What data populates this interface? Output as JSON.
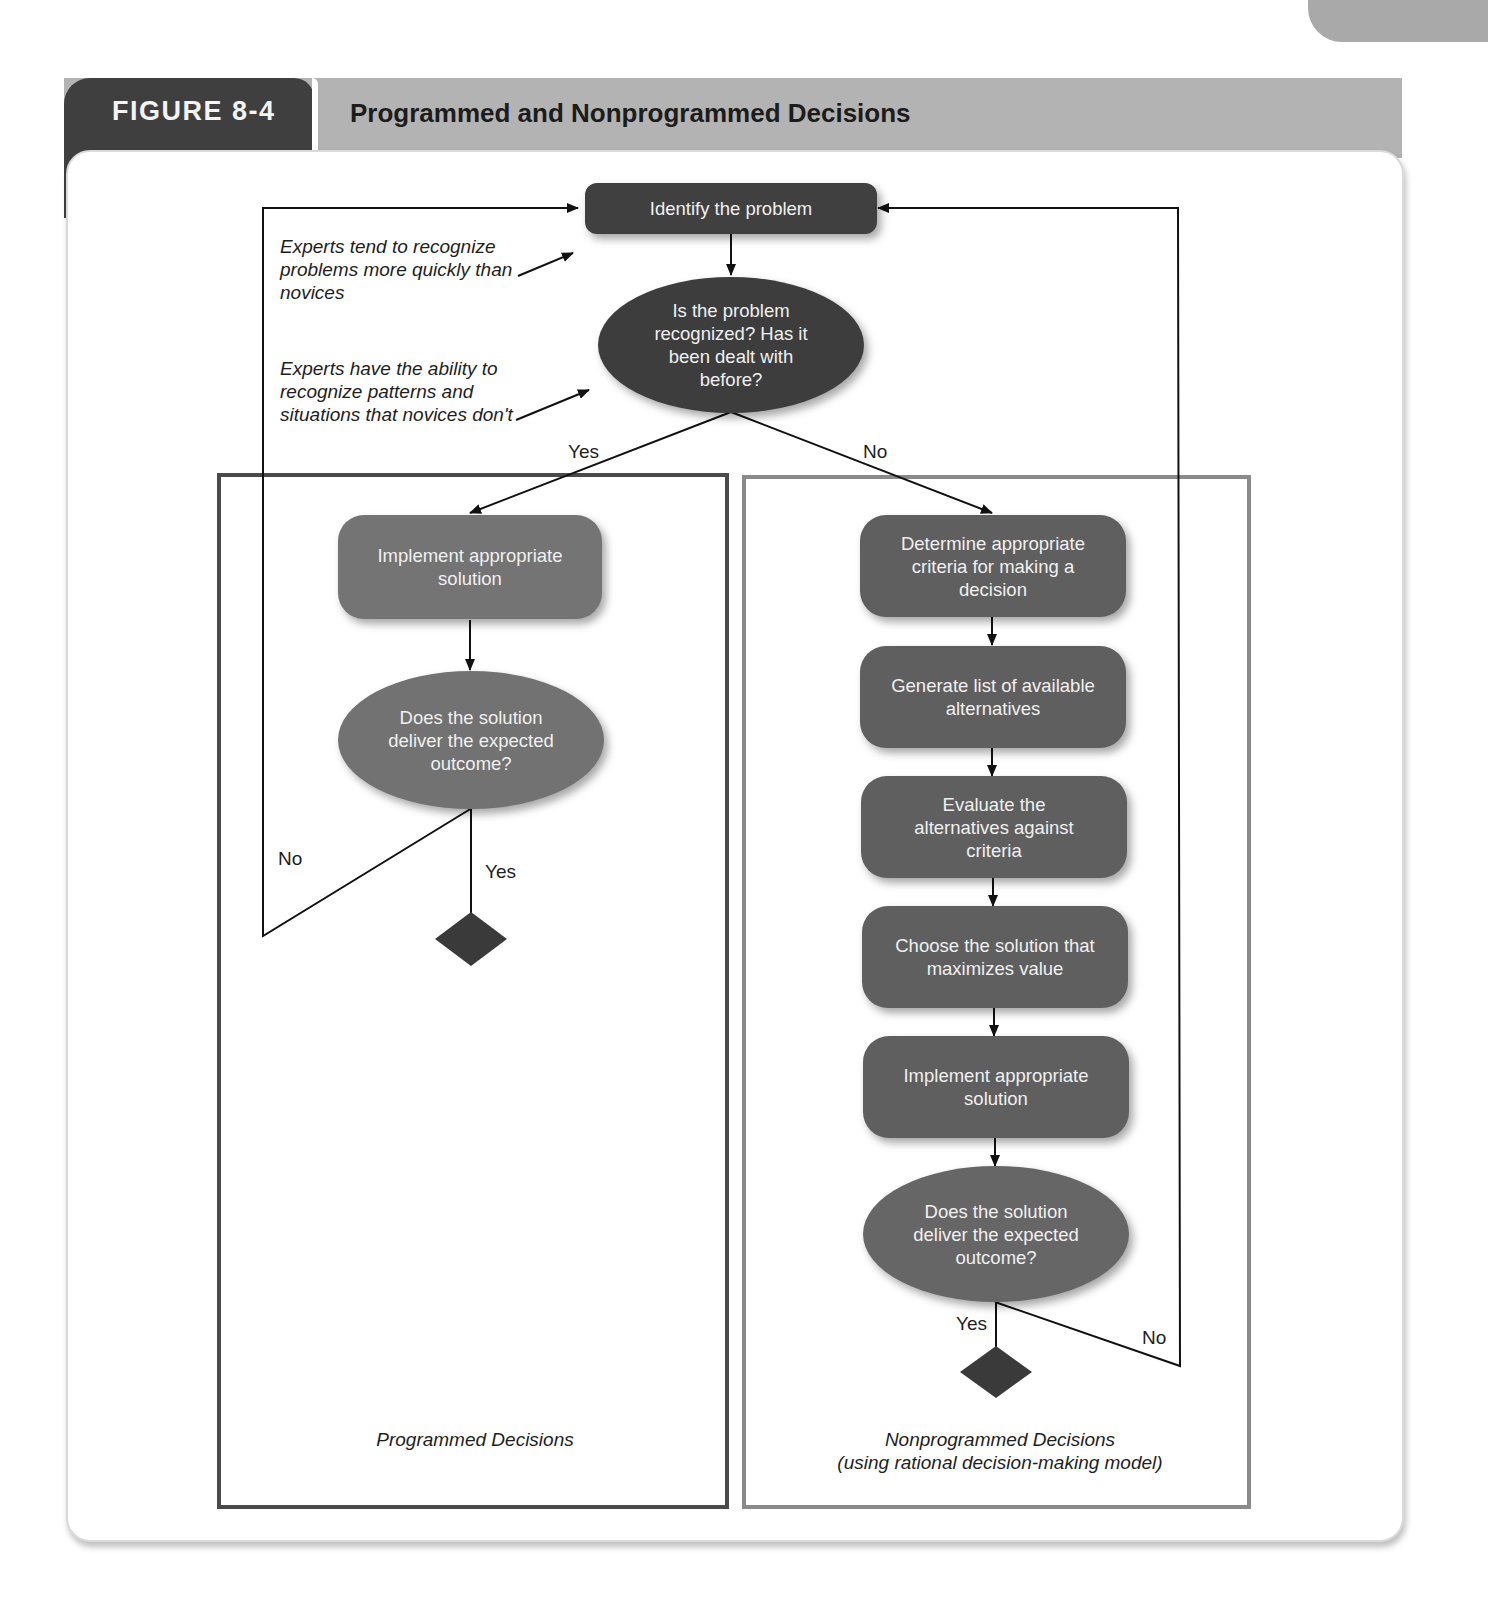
{
  "figure": {
    "label": "FIGURE 8-4",
    "title": "Programmed and Nonprogrammed Decisions"
  },
  "colors": {
    "header_band": "#b3b3b3",
    "label_tab": "#3f3f3f",
    "node_dark": "#404040",
    "node_programmed": "#747474",
    "node_nonprogrammed": "#5f5f5f",
    "panel_border_left": "#4a4a4a",
    "panel_border_right": "#8a8a8a"
  },
  "top": {
    "identify": "Identify the problem",
    "recognized": "Is the problem recognized? Has it been dealt with before?",
    "yes_label": "Yes",
    "no_label": "No"
  },
  "notes": {
    "experts_quick": "Experts tend to recognize problems more quickly than novices",
    "experts_patterns": "Experts have the ability to recognize patterns and situations that novices don't"
  },
  "programmed": {
    "implement": "Implement appropriate solution",
    "check": "Does the solution deliver the expected outcome?",
    "no_label": "No",
    "yes_label": "Yes",
    "caption": "Programmed Decisions"
  },
  "nonprogrammed": {
    "steps": [
      "Determine appropriate criteria for making a decision",
      "Generate list of available alternatives",
      "Evaluate the alternatives against criteria",
      "Choose the solution that maximizes value",
      "Implement appropriate solution"
    ],
    "check": "Does the solution deliver the expected outcome?",
    "yes_label": "Yes",
    "no_label": "No",
    "caption_line1": "Nonprogrammed Decisions",
    "caption_line2": "(using rational decision-making model)"
  }
}
